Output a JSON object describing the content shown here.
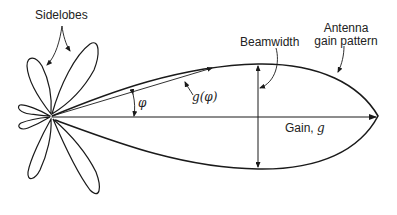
{
  "labels": {
    "sidelobes": "Sidelobes",
    "beamwidth": "Beamwidth",
    "antenna_line1": "Antenna",
    "antenna_line2": "gain pattern",
    "phi": "φ",
    "g_of_phi": "g(φ)",
    "gain_prefix": "Gain, ",
    "gain_symbol": "g"
  },
  "colors": {
    "stroke": "#1a1a1a",
    "text": "#222222",
    "background": "#ffffff"
  }
}
